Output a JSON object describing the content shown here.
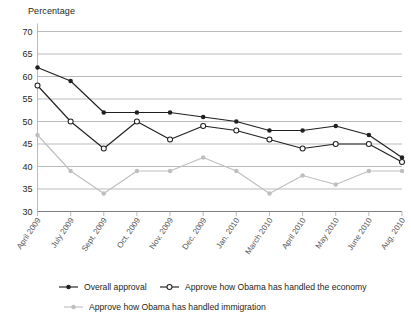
{
  "chart_data": {
    "type": "line",
    "title": "",
    "ylabel": "Percentage",
    "xlabel": "",
    "ylim": [
      30,
      70
    ],
    "ytick_step": 5,
    "yticks": [
      30,
      35,
      40,
      45,
      50,
      55,
      60,
      65,
      70
    ],
    "grid": true,
    "legend_position": "bottom",
    "categories": [
      "April 2009",
      "July 2009",
      "Sept. 2009",
      "Oct. 2009",
      "Nov. 2009",
      "Dec. 2009",
      "Jan. 2010",
      "March 2010",
      "April 2010",
      "May 2010",
      "June 2010",
      "Aug. 2010"
    ],
    "series": [
      {
        "name": "Overall approval",
        "color": "#231f20",
        "marker": "filled-circle",
        "values": [
          62,
          59,
          52,
          52,
          52,
          51,
          50,
          48,
          48,
          49,
          47,
          42
        ]
      },
      {
        "name": "Approve how Obama has handled the economy",
        "color": "#231f20",
        "marker": "open-circle",
        "values": [
          58,
          50,
          44,
          50,
          46,
          49,
          48,
          46,
          44,
          45,
          45,
          41
        ]
      },
      {
        "name": "Approve how Obama has handled immigration",
        "color": "#bfbfbf",
        "marker": "filled-circle",
        "values": [
          47,
          39,
          34,
          39,
          39,
          42,
          39,
          34,
          38,
          36,
          39,
          39
        ]
      }
    ]
  },
  "axis": {
    "y_title": "Percentage"
  },
  "legend": {
    "items": [
      {
        "label": "Overall approval",
        "marker": "filled-circle",
        "color": "#231f20"
      },
      {
        "label": "Approve how Obama has handled the economy",
        "marker": "open-circle",
        "color": "#231f20"
      },
      {
        "label": "Approve how Obama has handled immigration",
        "marker": "filled-circle",
        "color": "#bfbfbf"
      }
    ]
  }
}
